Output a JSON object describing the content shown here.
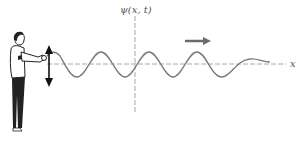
{
  "figure": {
    "labels": {
      "y_axis": "ψ(x, t)",
      "x_axis": "x"
    },
    "elements": {
      "person": "person-shaking-string",
      "shake_arrow": "double-headed-vertical-arrow",
      "direction_arrow": "rightward-propagation-arrow"
    },
    "colors": {
      "wave": "#7a7a7a",
      "axis": "#9a9a9a",
      "arrow": "#6a6a6a",
      "figure_ink": "#222222"
    },
    "wave": {
      "axis_y": 64,
      "amplitude_px": 12,
      "wavelength_px": 47,
      "start_x": 47,
      "end_x": 270
    }
  }
}
